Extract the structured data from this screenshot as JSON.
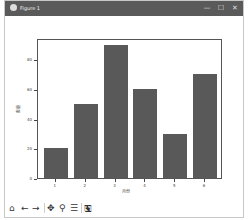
{
  "window": {
    "title": "Figure 1",
    "controls": {
      "minimize": "—",
      "maximize": "☐",
      "close": "✕"
    }
  },
  "toolbar": {
    "home": "⌂",
    "back": "←",
    "forward": "→",
    "pan": "✥",
    "zoom": "⚲",
    "configure": "☰",
    "save": "🖫"
  },
  "chart_data": {
    "type": "bar",
    "categories": [
      "1",
      "2",
      "3",
      "4",
      "5",
      "6"
    ],
    "values": [
      20,
      50,
      90,
      60,
      30,
      70
    ],
    "title": "",
    "xlabel": "月份",
    "ylabel": "数量",
    "ylim": [
      0,
      94.5
    ],
    "yticks": [
      "0",
      "20",
      "40",
      "60",
      "80"
    ],
    "bar_color": "#595959",
    "grid": false
  }
}
